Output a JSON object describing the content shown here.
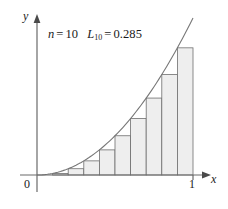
{
  "figure": {
    "name": "left-endpoint-riemann-sum-figure",
    "background_color": "#ffffff"
  },
  "annotation": {
    "n_symbol": "n",
    "n_equals": "=",
    "n_value": "10",
    "l_symbol": "L",
    "l_subscript": "10",
    "l_equals": "=",
    "l_value": "0.285"
  },
  "axes": {
    "y_label": "y",
    "x_label": "x",
    "origin_label": "0",
    "x_tick_label": "1",
    "axis_color": "#555555",
    "x_range": [
      0,
      1
    ],
    "y_range": [
      0,
      1
    ]
  },
  "style": {
    "bar_fill": "#eeeeee",
    "bar_stroke": "#6e6e6e",
    "curve_color": "#777777",
    "text_color": "#1a1a1a"
  },
  "chart_data": {
    "type": "bar",
    "title": "",
    "subtitle": "",
    "xlabel": "x",
    "ylabel": "y",
    "xlim": [
      0,
      1
    ],
    "ylim": [
      0,
      1
    ],
    "grid": false,
    "legend": "none",
    "annotations": [
      "n = 10",
      "L₁₀ = 0.285"
    ],
    "function": "y = x^2",
    "n": 10,
    "sum_value": 0.285,
    "bar_left_edges": [
      0.0,
      0.1,
      0.2,
      0.3,
      0.4,
      0.5,
      0.6,
      0.7,
      0.8,
      0.9
    ],
    "bar_right_edges": [
      0.1,
      0.2,
      0.3,
      0.4,
      0.5,
      0.6,
      0.7,
      0.8,
      0.9,
      1.0
    ],
    "bar_width": 0.1,
    "categories": [
      "[0,0.1]",
      "[0.1,0.2]",
      "[0.2,0.3]",
      "[0.3,0.4]",
      "[0.4,0.5]",
      "[0.5,0.6]",
      "[0.6,0.7]",
      "[0.7,0.8]",
      "[0.8,0.9]",
      "[0.9,1.0]"
    ],
    "values": [
      0.0,
      0.01,
      0.04,
      0.09,
      0.16,
      0.25,
      0.36,
      0.49,
      0.64,
      0.81
    ],
    "curve": {
      "name": "y = x²",
      "x": [
        0.0,
        0.1,
        0.2,
        0.3,
        0.4,
        0.5,
        0.6,
        0.7,
        0.8,
        0.9,
        1.0
      ],
      "y": [
        0.0,
        0.01,
        0.04,
        0.09,
        0.16,
        0.25,
        0.36,
        0.49,
        0.64,
        0.81,
        1.0
      ]
    }
  }
}
